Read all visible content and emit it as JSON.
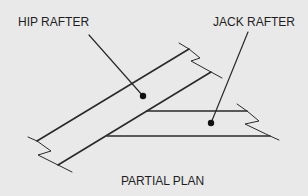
{
  "diagram": {
    "labels": {
      "hip_rafter": "HIP RAFTER",
      "jack_rafter": "JACK RAFTER"
    },
    "caption": "PARTIAL PLAN",
    "colors": {
      "background": "#e9e9e9",
      "line": "#2a2a2a",
      "text": "#1e1e1e"
    },
    "elements": [
      {
        "name": "hip-rafter",
        "description": "Diagonal rafter with break lines at both ends"
      },
      {
        "name": "jack-rafter",
        "description": "Horizontal rafter framing into the hip rafter, break line at right end"
      }
    ]
  }
}
